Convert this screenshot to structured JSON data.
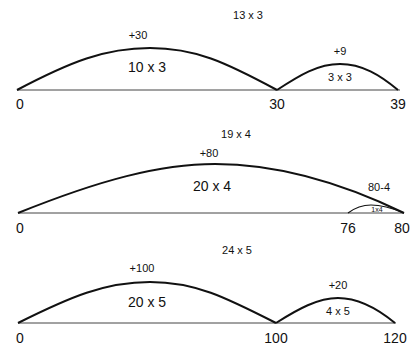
{
  "diagrams": [
    {
      "title": "13 x 3",
      "jumps": [
        {
          "label": "+30",
          "inner": "10 x 3"
        },
        {
          "label": "+9",
          "inner": "3 x 3"
        }
      ],
      "ticks": [
        "0",
        "30",
        "39"
      ]
    },
    {
      "title": "19 x 4",
      "jumps": [
        {
          "label": "+80",
          "inner": "20 x 4"
        },
        {
          "label": "80-4",
          "inner": "1x4"
        }
      ],
      "ticks": [
        "0",
        "76",
        "80"
      ]
    },
    {
      "title": "24 x 5",
      "jumps": [
        {
          "label": "+100",
          "inner": "20 x 5"
        },
        {
          "label": "+20",
          "inner": "4 x 5"
        }
      ],
      "ticks": [
        "0",
        "100",
        "120"
      ]
    }
  ],
  "colors": {
    "line": "#111111",
    "baseline": "#444444",
    "background": "#ffffff"
  }
}
